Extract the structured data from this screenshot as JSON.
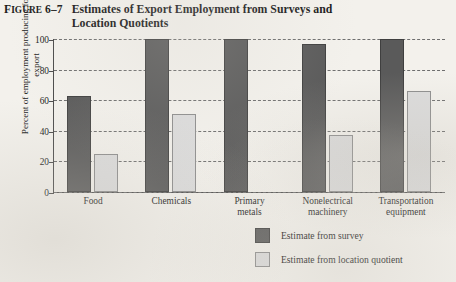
{
  "figure": {
    "number_prefix": "F",
    "number_rest": "IGURE",
    "number_value": "6–7",
    "title": "Estimates of Export Employment from Surveys and Location Quotients"
  },
  "legend": {
    "position": "bottom-center",
    "entries": [
      {
        "label": "Estimate from survey",
        "color": "#5a5a5a"
      },
      {
        "label": "Estimate from location quotient",
        "color": "#dcdcdc"
      }
    ]
  },
  "chart_data": {
    "type": "bar",
    "title": "Estimates of Export Employment from Surveys and Location Quotients",
    "xlabel": "",
    "ylabel": "Percent of employment producing for export",
    "ylim": [
      0,
      100
    ],
    "yticks": [
      0,
      20,
      40,
      60,
      80,
      100
    ],
    "ytick_labels": [
      "0",
      "20",
      "40",
      "60",
      "80",
      "100"
    ],
    "grid": true,
    "grid_style": "dashed-horizontal",
    "categories": [
      "Food",
      "Chemicals",
      "Primary metals",
      "Nonelectrical machinery",
      "Transportation equipment"
    ],
    "category_lines": [
      [
        "Food"
      ],
      [
        "Chemicals"
      ],
      [
        "Primary",
        "metals"
      ],
      [
        "Nonelectrical",
        "machinery"
      ],
      [
        "Transportation",
        "equipment"
      ]
    ],
    "series": [
      {
        "name": "Estimate from survey",
        "color": "#5a5a5a",
        "values": [
          63,
          100,
          100,
          97,
          100
        ]
      },
      {
        "name": "Estimate from location quotient",
        "color": "#dcdcdc",
        "values": [
          25,
          51,
          null,
          37,
          66
        ]
      }
    ]
  }
}
